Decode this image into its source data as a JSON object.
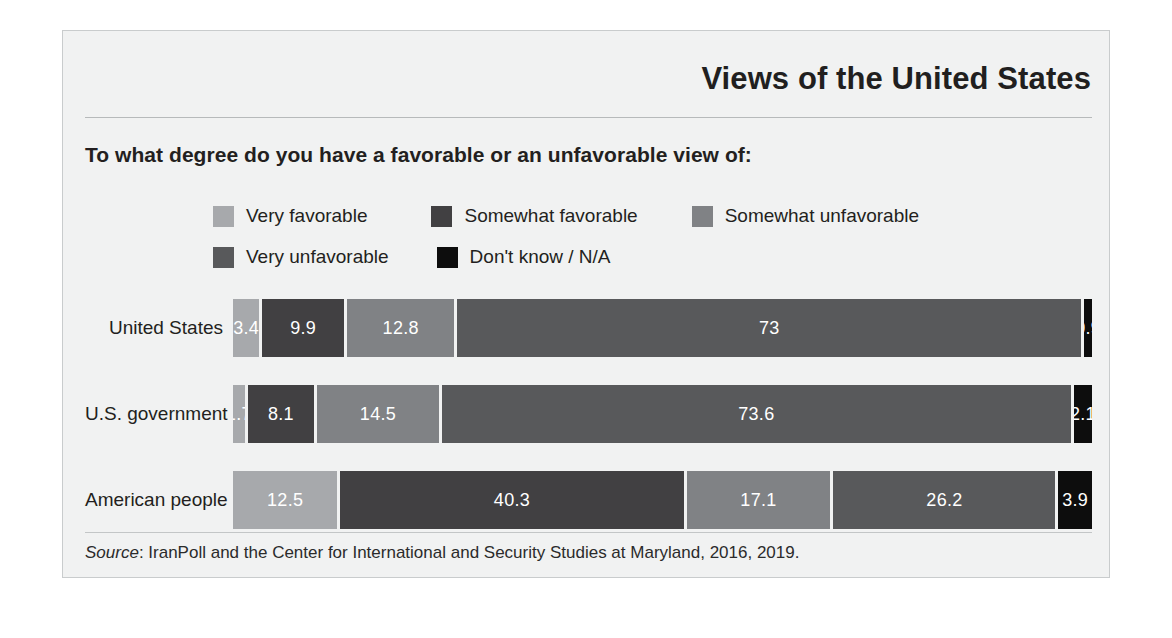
{
  "page": {
    "background_color": "#ffffff",
    "panel_color": "#f1f2f2",
    "ghost_text": "A Deepening Chasm between Islamic and Western Traditions"
  },
  "header": {
    "title": "Views of the United States",
    "question": "To what degree do you have a favorable or an unfavorable view of:"
  },
  "legend": {
    "items": [
      {
        "label": "Very favorable",
        "color": "#a7a9ac"
      },
      {
        "label": "Somewhat favorable",
        "color": "#414042"
      },
      {
        "label": "Somewhat unfavorable",
        "color": "#808285"
      },
      {
        "label": "Very unfavorable",
        "color": "#58595b"
      },
      {
        "label": "Don't know / N/A",
        "color": "#0d0d0d"
      }
    ]
  },
  "source": {
    "prefix": "Source",
    "text": ": IranPoll and the Center for International and Security Studies at Maryland, 2016, 2019."
  },
  "chart_data": {
    "type": "bar",
    "orientation": "horizontal",
    "stacked": true,
    "normalized_percent": true,
    "title": "Views of the United States",
    "subtitle": "To what degree do you have a favorable or an unfavorable view of:",
    "xlabel": "",
    "ylabel": "",
    "xlim": [
      0,
      100
    ],
    "grid": false,
    "legend_position": "top",
    "categories": [
      "United States",
      "U.S. government",
      "American people"
    ],
    "series": [
      {
        "name": "Very favorable",
        "color": "#a7a9ac",
        "values": [
          3.4,
          1.7,
          12.5
        ]
      },
      {
        "name": "Somewhat favorable",
        "color": "#414042",
        "values": [
          9.9,
          8.1,
          40.3
        ]
      },
      {
        "name": "Somewhat unfavorable",
        "color": "#808285",
        "values": [
          12.8,
          14.5,
          17.1
        ]
      },
      {
        "name": "Very unfavorable",
        "color": "#58595b",
        "values": [
          73,
          73.6,
          26.2
        ]
      },
      {
        "name": "Don't know / N/A",
        "color": "#0d0d0d",
        "values": [
          0.9,
          2.1,
          3.9
        ]
      }
    ],
    "rows": [
      {
        "label": "United States",
        "segments": [
          {
            "name": "Very favorable",
            "value": 3.4,
            "display": "3.4",
            "color": "#a7a9ac"
          },
          {
            "name": "Somewhat favorable",
            "value": 9.9,
            "display": "9.9",
            "color": "#414042"
          },
          {
            "name": "Somewhat unfavorable",
            "value": 12.8,
            "display": "12.8",
            "color": "#808285"
          },
          {
            "name": "Very unfavorable",
            "value": 73,
            "display": "73",
            "color": "#58595b"
          },
          {
            "name": "Don't know / N/A",
            "value": 0.9,
            "display": "0.9",
            "color": "#0d0d0d"
          }
        ]
      },
      {
        "label": "U.S. government",
        "segments": [
          {
            "name": "Very favorable",
            "value": 1.7,
            "display": "1.7",
            "color": "#a7a9ac"
          },
          {
            "name": "Somewhat favorable",
            "value": 8.1,
            "display": "8.1",
            "color": "#414042"
          },
          {
            "name": "Somewhat unfavorable",
            "value": 14.5,
            "display": "14.5",
            "color": "#808285"
          },
          {
            "name": "Very unfavorable",
            "value": 73.6,
            "display": "73.6",
            "color": "#58595b"
          },
          {
            "name": "Don't know / N/A",
            "value": 2.1,
            "display": "2.1",
            "color": "#0d0d0d"
          }
        ]
      },
      {
        "label": "American people",
        "segments": [
          {
            "name": "Very favorable",
            "value": 12.5,
            "display": "12.5",
            "color": "#a7a9ac"
          },
          {
            "name": "Somewhat favorable",
            "value": 40.3,
            "display": "40.3",
            "color": "#414042"
          },
          {
            "name": "Somewhat unfavorable",
            "value": 17.1,
            "display": "17.1",
            "color": "#808285"
          },
          {
            "name": "Very unfavorable",
            "value": 26.2,
            "display": "26.2",
            "color": "#58595b"
          },
          {
            "name": "Don't know / N/A",
            "value": 3.9,
            "display": "3.9",
            "color": "#0d0d0d"
          }
        ]
      }
    ]
  }
}
